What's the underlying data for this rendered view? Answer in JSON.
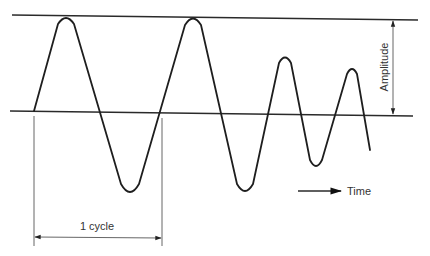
{
  "diagram": {
    "type": "waveform",
    "labels": {
      "amplitude": "Amplitude",
      "cycle": "1 cycle",
      "time": "Time"
    },
    "colors": {
      "stroke": "#1e1e1e",
      "background": "#ffffff"
    },
    "elements": [
      "top reference line (peak level)",
      "baseline (zero level)",
      "oscillating waveform with decreasing amplitude",
      "amplitude dimension arrow",
      "one-cycle dimension arrow",
      "time direction arrow"
    ]
  }
}
